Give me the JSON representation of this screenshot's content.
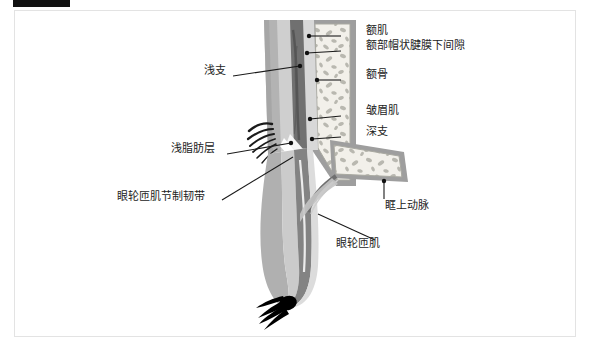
{
  "figure": {
    "kind": "anatomical-cross-section",
    "region": "forehead-and-upper-eyelid-sagittal",
    "frame_border_color": "#e3e3e3",
    "background_color": "#ffffff",
    "redaction_bar_color": "#111111",
    "palette": {
      "skin_outer": "#b9b9b9",
      "fat_layer": "#d2d2d2",
      "muscle_dark": "#6f6f6f",
      "muscle_mid": "#8d8d8d",
      "bone_fill": "#eeece6",
      "bone_speckle": "#b5b5ad",
      "periosteum": "#9a9a9a",
      "highlight_white": "#ffffff",
      "lash_black": "#000000",
      "leader_line": "#1a1a1a"
    }
  },
  "labels": {
    "right": [
      {
        "text": "额肌",
        "x": 366,
        "y": 30,
        "line_from_x": 341,
        "line_from_y": 36,
        "line_to_x": 309,
        "line_to_y": 36,
        "dot_x": 309,
        "dot_y": 36
      },
      {
        "text": "额部帽状腱膜下间隙",
        "x": 366,
        "y": 45,
        "line_from_x": 341,
        "line_from_y": 51,
        "line_to_x": 307,
        "line_to_y": 53,
        "dot_x": 307,
        "dot_y": 53
      },
      {
        "text": "额骨",
        "x": 366,
        "y": 74,
        "line_from_x": 341,
        "line_from_y": 80,
        "line_to_x": 317,
        "line_to_y": 80,
        "dot_x": 317,
        "dot_y": 80
      },
      {
        "text": "皱眉肌",
        "x": 366,
        "y": 110,
        "line_from_x": 341,
        "line_from_y": 116,
        "line_to_x": 310,
        "line_to_y": 119,
        "dot_x": 310,
        "dot_y": 119
      },
      {
        "text": "深支",
        "x": 366,
        "y": 131,
        "line_from_x": 341,
        "line_from_y": 137,
        "line_to_x": 312,
        "line_to_y": 139,
        "dot_x": 312,
        "dot_y": 139
      },
      {
        "text": "眶上动脉",
        "x": 385,
        "y": 205,
        "line_from_x": 384,
        "line_from_y": 199,
        "line_to_x": 384,
        "line_to_y": 181,
        "dot_x": 384,
        "dot_y": 181
      },
      {
        "text": "眼轮匝肌",
        "x": 336,
        "y": 243,
        "line_from_x": 375,
        "line_from_y": 240,
        "line_to_x": 318,
        "line_to_y": 214,
        "dot_x": 318,
        "dot_y": 214
      }
    ],
    "left": [
      {
        "text": "浅支",
        "x": 204,
        "y": 70,
        "line_from_x": 233,
        "line_from_y": 76,
        "line_to_x": 300,
        "line_to_y": 66,
        "dot_x": 300,
        "dot_y": 66
      },
      {
        "text": "浅脂肪层",
        "x": 171,
        "y": 148,
        "line_from_x": 227,
        "line_from_y": 154,
        "line_to_x": 291,
        "line_to_y": 143,
        "dot_x": 291,
        "dot_y": 143
      },
      {
        "text": "眼轮匝肌节制韧带",
        "x": 117,
        "y": 196,
        "line_from_x": 222,
        "line_from_y": 200,
        "line_to_x": 293,
        "line_to_y": 157,
        "dot_x": 293,
        "dot_y": 157
      }
    ]
  }
}
